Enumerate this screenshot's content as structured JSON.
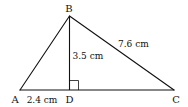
{
  "figure": {
    "type": "triangle-with-altitude",
    "stroke_color": "#111111",
    "background": "#ffffff"
  },
  "vertices": {
    "A": {
      "label": "A"
    },
    "B": {
      "label": "B"
    },
    "C": {
      "label": "C"
    },
    "D": {
      "label": "D"
    }
  },
  "measurements": {
    "AD": {
      "label": "2.4 cm",
      "value": 2.4,
      "unit": "cm"
    },
    "BD": {
      "label": "3.5 cm",
      "value": 3.5,
      "unit": "cm"
    },
    "BC": {
      "label": "7.6 cm",
      "value": 7.6,
      "unit": "cm"
    }
  },
  "annotations": {
    "right_angle_at": "D"
  }
}
